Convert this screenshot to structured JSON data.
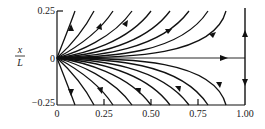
{
  "diagram": {
    "title": "",
    "type": "phase-portrait",
    "ylabel": {
      "numerator": "x",
      "denominator": "L"
    },
    "y_ticks": [
      "0.25",
      "0",
      "−0.25"
    ],
    "x_ticks": [
      "0",
      "0.25",
      "0.50",
      "0.75",
      "1.00"
    ],
    "xlim": [
      0,
      1.0
    ],
    "ylim": [
      -0.25,
      0.25
    ],
    "curve_end_x": [
      0.1,
      0.2,
      0.3,
      0.4,
      0.5,
      0.6,
      0.7,
      0.8,
      0.9
    ],
    "line_color": "#111111",
    "features": [
      "Trajectories emanate from the origin and curve outward to y = ±0.25",
      "Horizontal trajectory along y = 0 from 0 to 1.00, arrow pointing right",
      "Vertical line at x = 1.00 with arrows pointing away from y = 0"
    ]
  }
}
